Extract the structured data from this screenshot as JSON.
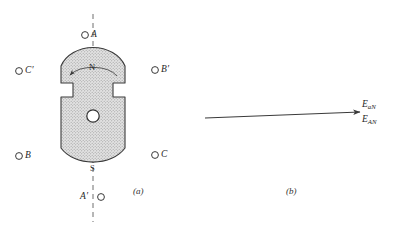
{
  "figure": {
    "panel_a": {
      "caption": "(a)",
      "rotor": {
        "north_pole_label": "N",
        "south_pole_label": "S",
        "rotation_direction": "counterclockwise",
        "fill_color": "#d9d9d9",
        "outline_color": "#3a3a3a"
      },
      "axis_label_top": "A",
      "axis_label_bottom": "A′",
      "terminals": [
        {
          "id": "terminal-a",
          "label": "A",
          "position": "top",
          "marker": "circle"
        },
        {
          "id": "terminal-a-prime",
          "label": "A′",
          "position": "bottom",
          "marker": "circle"
        },
        {
          "id": "terminal-c-prime",
          "label": "C′",
          "position": "upper-left",
          "marker": "circle"
        },
        {
          "id": "terminal-b-prime",
          "label": "B′",
          "position": "upper-right",
          "marker": "circle"
        },
        {
          "id": "terminal-b",
          "label": "B",
          "position": "lower-left",
          "marker": "circle"
        },
        {
          "id": "terminal-c",
          "label": "C",
          "position": "lower-right",
          "marker": "circle"
        }
      ]
    },
    "panel_b": {
      "caption": "(b)",
      "arrow_direction": "right",
      "phasors": [
        {
          "id": "phasor-ean-upper",
          "symbol": "E",
          "subscript": "aN"
        },
        {
          "id": "phasor-ean-lower",
          "symbol": "E",
          "subscript": "AN"
        }
      ]
    }
  }
}
